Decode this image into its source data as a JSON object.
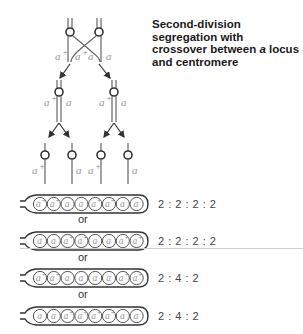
{
  "title": {
    "line1": "Second-division segregation with",
    "line2_pre": "crossover between ",
    "line2_em": "a",
    "line2_post": " locus",
    "line3": "and centromere"
  },
  "alleles": {
    "wild": "a+",
    "mutant": "a"
  },
  "top_labels": [
    "a+",
    "a+ a",
    "a"
  ],
  "mid_labels": [
    {
      "left": "a+",
      "right": "a"
    },
    {
      "left": "a+",
      "right": "a"
    }
  ],
  "bottom_labels": [
    "a+",
    "a",
    "a+",
    "a"
  ],
  "asci": [
    {
      "spores": [
        "a+",
        "a+",
        "a",
        "a",
        "a+",
        "a+",
        "a",
        "a"
      ],
      "ratio": "2 : 2 : 2 : 2"
    },
    {
      "spores": [
        "a",
        "a",
        "a+",
        "a+",
        "a",
        "a",
        "a+",
        "a+"
      ],
      "ratio": "2 : 2 : 2 : 2"
    },
    {
      "spores": [
        "a+",
        "a+",
        "a",
        "a",
        "a",
        "a",
        "a+",
        "a+"
      ],
      "ratio": "2 : 4 : 2"
    },
    {
      "spores": [
        "a",
        "a",
        "a+",
        "a+",
        "a+",
        "a+",
        "a",
        "a"
      ],
      "ratio": "2 : 4 : 2"
    }
  ],
  "separator": "or",
  "colors": {
    "line": "#555555",
    "label": "#999999",
    "text": "#1a1a1a"
  }
}
